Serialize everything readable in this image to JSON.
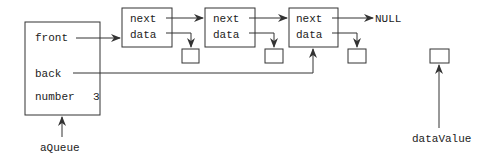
{
  "queue": {
    "name": "aQueue",
    "fields": {
      "front": "front",
      "back": "back",
      "number": "number",
      "number_value": "3"
    }
  },
  "nodes": [
    {
      "next": "next",
      "data": "data"
    },
    {
      "next": "next",
      "data": "data"
    },
    {
      "next": "next",
      "data": "data"
    }
  ],
  "terminator": "NULL",
  "data_value": {
    "name": "dataValue"
  },
  "colors": {
    "stroke": "#333333",
    "background": "#ffffff"
  }
}
